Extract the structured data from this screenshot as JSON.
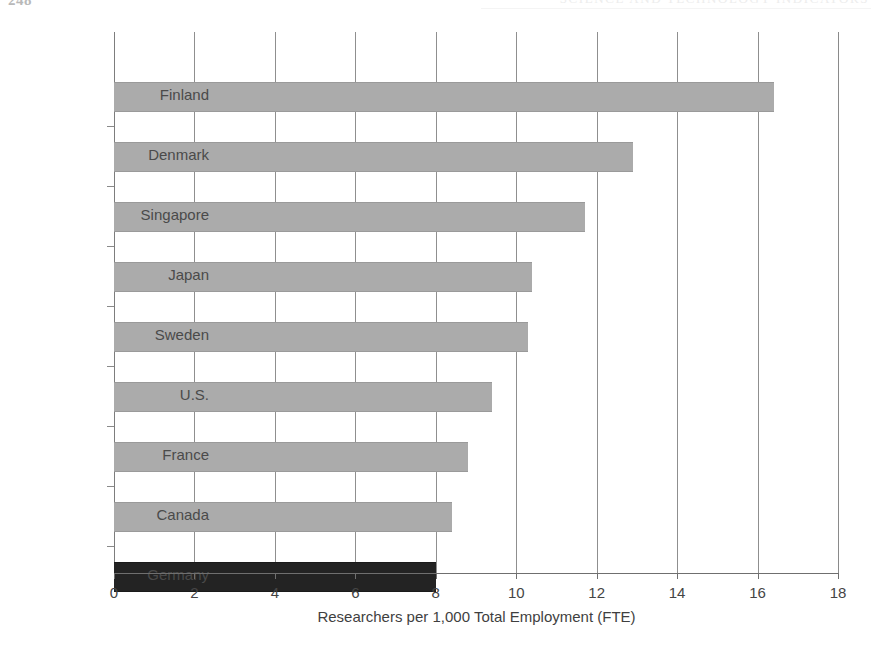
{
  "page": {
    "folio": "248",
    "running_head": "SCIENCE AND TECHNOLOGY INDICATORS"
  },
  "chart_data": {
    "type": "bar",
    "orientation": "horizontal",
    "title": "",
    "subtitle": "",
    "xlabel": "Researchers per 1,000 Total Employment (FTE)",
    "ylabel": "",
    "xlim": [
      0,
      18
    ],
    "xticks": [
      0,
      2,
      4,
      6,
      8,
      10,
      12,
      14,
      16,
      18
    ],
    "xtick_labels": [
      "0",
      "2",
      "4",
      "6",
      "8",
      "10",
      "12",
      "14",
      "16",
      "18"
    ],
    "grid": "vertical",
    "legend": "none",
    "categories": [
      "Finland",
      "Denmark",
      "Singapore",
      "Japan",
      "Sweden",
      "U.S.",
      "France",
      "Canada",
      "Germany"
    ],
    "values": [
      16.4,
      12.9,
      11.7,
      10.4,
      10.3,
      9.4,
      8.8,
      8.4,
      8.0
    ],
    "series": [
      {
        "name": "Researchers per 1,000 total employment (FTE)",
        "values": [
          16.4,
          12.9,
          11.7,
          10.4,
          10.3,
          9.4,
          8.8,
          8.4,
          8.0
        ]
      }
    ],
    "bars": [
      {
        "category": "Finland",
        "value": 16.4,
        "color": "#ababab",
        "highlighted": false
      },
      {
        "category": "Denmark",
        "value": 12.9,
        "color": "#ababab",
        "highlighted": false
      },
      {
        "category": "Singapore",
        "value": 11.7,
        "color": "#ababab",
        "highlighted": false
      },
      {
        "category": "Japan",
        "value": 10.4,
        "color": "#ababab",
        "highlighted": false
      },
      {
        "category": "Sweden",
        "value": 10.3,
        "color": "#ababab",
        "highlighted": false
      },
      {
        "category": "U.S.",
        "value": 9.4,
        "color": "#ababab",
        "highlighted": false
      },
      {
        "category": "France",
        "value": 8.8,
        "color": "#ababab",
        "highlighted": false
      },
      {
        "category": "Canada",
        "value": 8.4,
        "color": "#ababab",
        "highlighted": false
      },
      {
        "category": "Germany",
        "value": 8.0,
        "color": "#232323",
        "highlighted": true
      }
    ],
    "colors": {
      "bar_default": "#ababab",
      "bar_highlight": "#232323",
      "gridline": "#8f8f8f",
      "axis": "#6f6f6f",
      "text": "#454545"
    }
  }
}
